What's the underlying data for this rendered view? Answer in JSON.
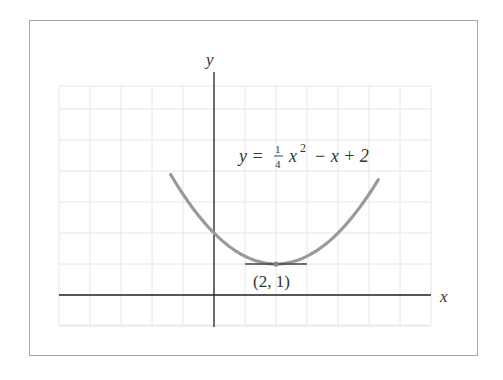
{
  "chart_data": {
    "type": "line",
    "title": "",
    "equation": "y = 1/4 x^2 - x + 2",
    "equation_parts": {
      "lhs": "y =",
      "frac_num": "1",
      "frac_den": "4",
      "term": "x",
      "exp": "2",
      "rest": "− x + 2"
    },
    "xlabel": "x",
    "ylabel": "y",
    "xlim": [
      -5,
      7
    ],
    "ylim": [
      -1,
      7
    ],
    "grid": true,
    "series": [
      {
        "name": "y = 1/4 x^2 - x + 2",
        "x": [
          -1.4,
          -1,
          0,
          1,
          2,
          3,
          4,
          5,
          5.3
        ],
        "y": [
          3.89,
          3.25,
          2,
          1.25,
          1,
          1.25,
          2,
          3.25,
          3.72
        ],
        "color": "#9a9a9a"
      }
    ],
    "annotations": [
      {
        "type": "point",
        "x": 2,
        "y": 1,
        "label": "(2, 1)"
      },
      {
        "type": "tangent-line",
        "y": 1,
        "x_from": 1,
        "x_to": 3
      }
    ]
  },
  "colors": {
    "frame": "#a8a8a8",
    "grid": "#e6e6e6",
    "axis": "#222222",
    "curve": "#9a9a9a",
    "tangent": "#444444"
  }
}
